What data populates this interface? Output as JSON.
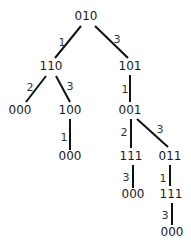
{
  "diagram": {
    "type": "tree",
    "nodes": [
      {
        "id": "n0",
        "label": "010",
        "x": 86,
        "y": 16
      },
      {
        "id": "n1",
        "label": "110",
        "x": 51,
        "y": 66
      },
      {
        "id": "n2",
        "label": "101",
        "x": 130,
        "y": 66
      },
      {
        "id": "n3",
        "label": "000",
        "x": 20,
        "y": 110
      },
      {
        "id": "n4",
        "label": "100",
        "x": 70,
        "y": 110
      },
      {
        "id": "n5",
        "label": "001",
        "x": 130,
        "y": 110
      },
      {
        "id": "n6",
        "label": "000",
        "x": 70,
        "y": 156
      },
      {
        "id": "n7",
        "label": "111",
        "x": 131,
        "y": 156
      },
      {
        "id": "n8",
        "label": "011",
        "x": 170,
        "y": 156
      },
      {
        "id": "n9",
        "label": "000",
        "x": 133,
        "y": 194
      },
      {
        "id": "n10",
        "label": "111",
        "x": 171,
        "y": 194
      },
      {
        "id": "n11",
        "label": "000",
        "x": 172,
        "y": 232
      }
    ],
    "edges": [
      {
        "from": "n0",
        "to": "n1",
        "label": "1",
        "x1": 81,
        "y1": 26,
        "x2": 55,
        "y2": 58,
        "lx": 62,
        "ly": 43
      },
      {
        "from": "n0",
        "to": "n2",
        "label": "3",
        "x1": 95,
        "y1": 26,
        "x2": 128,
        "y2": 58,
        "lx": 117,
        "ly": 40
      },
      {
        "from": "n1",
        "to": "n3",
        "label": "2",
        "x1": 46,
        "y1": 76,
        "x2": 26,
        "y2": 102,
        "lx": 30,
        "ly": 88
      },
      {
        "from": "n1",
        "to": "n4",
        "label": "3",
        "x1": 56,
        "y1": 76,
        "x2": 70,
        "y2": 102,
        "lx": 70,
        "ly": 87
      },
      {
        "from": "n2",
        "to": "n5",
        "label": "1",
        "x1": 130,
        "y1": 75,
        "x2": 130,
        "y2": 102,
        "lx": 125,
        "ly": 90
      },
      {
        "from": "n4",
        "to": "n6",
        "label": "1",
        "x1": 70,
        "y1": 119,
        "x2": 70,
        "y2": 150,
        "lx": 64,
        "ly": 138
      },
      {
        "from": "n5",
        "to": "n7",
        "label": "2",
        "x1": 131,
        "y1": 119,
        "x2": 131,
        "y2": 148,
        "lx": 124,
        "ly": 133
      },
      {
        "from": "n5",
        "to": "n8",
        "label": "3",
        "x1": 137,
        "y1": 119,
        "x2": 168,
        "y2": 147,
        "lx": 160,
        "ly": 130
      },
      {
        "from": "n7",
        "to": "n9",
        "label": "3",
        "x1": 133,
        "y1": 165,
        "x2": 133,
        "y2": 188,
        "lx": 126,
        "ly": 178
      },
      {
        "from": "n8",
        "to": "n10",
        "label": "1",
        "x1": 170,
        "y1": 165,
        "x2": 170,
        "y2": 186,
        "lx": 163,
        "ly": 179
      },
      {
        "from": "n10",
        "to": "n11",
        "label": "3",
        "x1": 172,
        "y1": 203,
        "x2": 172,
        "y2": 225,
        "lx": 165,
        "ly": 216
      }
    ]
  }
}
